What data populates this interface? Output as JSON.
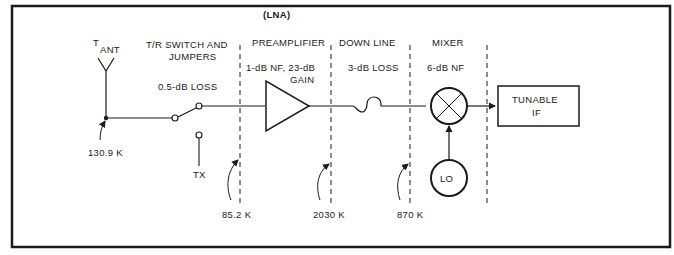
{
  "diagram": {
    "antenna": {
      "label_main": "T",
      "label_sub": "ANT",
      "temperature": "130.9 K"
    },
    "stages": [
      {
        "title_line1": "T/R SWITCH AND",
        "title_line2": "JUMPERS",
        "spec": "0.5-dB LOSS"
      },
      {
        "title_top": "(LNA)",
        "title": "PREAMPLIFIER",
        "spec_line1": "1-dB NF, 23-dB",
        "spec_line2": "GAIN"
      },
      {
        "title": "DOWN LINE",
        "spec": "3-dB LOSS"
      },
      {
        "title": "MIXER",
        "spec": "6-dB NF"
      }
    ],
    "switch": {
      "tx_label": "TX"
    },
    "reference_points": [
      {
        "temperature": "85.2 K"
      },
      {
        "temperature": "2030 K"
      },
      {
        "temperature": "870 K"
      }
    ],
    "oscillator": {
      "label": "LO"
    },
    "output_block": {
      "line1": "TUNABLE",
      "line2": "IF"
    }
  }
}
